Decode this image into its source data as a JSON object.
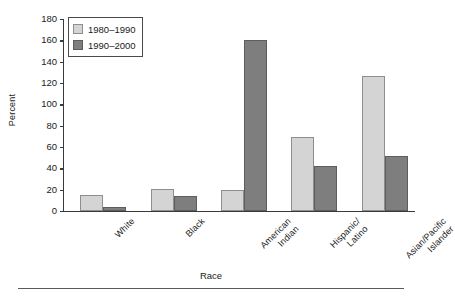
{
  "chart_data": {
    "type": "bar",
    "title": "",
    "xlabel": "Race",
    "ylabel": "Percent",
    "categories": [
      "White",
      "Black",
      "American\nIndian",
      "Hispanic/\nLatino",
      "Asian/Pacific\nIslander"
    ],
    "series": [
      {
        "name": "1980–1990",
        "color": "#d4d4d4",
        "values": [
          15,
          21,
          20,
          69,
          127
        ]
      },
      {
        "name": "1990–2000",
        "color": "#7e7e7e",
        "values": [
          4,
          14,
          160,
          42,
          52
        ]
      }
    ],
    "ylim": [
      0,
      180
    ],
    "yticks": [
      0,
      20,
      40,
      60,
      80,
      100,
      120,
      140,
      160,
      180
    ],
    "grid": false,
    "legend_position": "top-left"
  }
}
